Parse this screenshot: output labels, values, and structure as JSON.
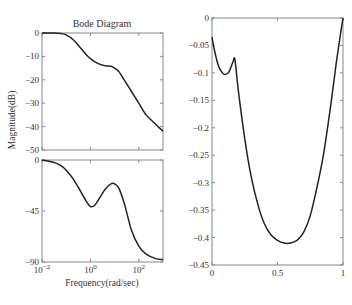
{
  "chart_data": [
    {
      "type": "line",
      "title": "Bode Diagram",
      "panel": "magnitude",
      "xlabel": "",
      "ylabel": "Magnitude(dB)",
      "xscale": "log",
      "xlim": [
        0.01,
        1000
      ],
      "ylim": [
        -50,
        0
      ],
      "yticks": [
        0,
        -10,
        -20,
        -30,
        -40,
        -50
      ],
      "ytick_labels": [
        "0",
        "-10",
        "-20",
        "-30",
        "-40",
        "-50"
      ],
      "x": [
        0.01,
        0.03,
        0.06,
        0.1,
        0.2,
        0.4,
        0.7,
        1,
        2,
        4,
        7,
        10,
        15,
        25,
        50,
        100,
        200,
        500,
        1000
      ],
      "values": [
        0,
        0,
        -0.2,
        -0.8,
        -3,
        -6.5,
        -9.5,
        -11,
        -13,
        -14,
        -14.2,
        -15,
        -16.5,
        -20,
        -25,
        -30,
        -35,
        -39,
        -42
      ]
    },
    {
      "type": "line",
      "panel": "phase",
      "xlabel": "Frequency(rad/sec)",
      "ylabel": "",
      "xscale": "log",
      "xlim": [
        0.01,
        1000
      ],
      "ylim": [
        -90,
        0
      ],
      "yticks": [
        0,
        -45,
        -90
      ],
      "ytick_labels": [
        "0",
        "-45",
        "-90"
      ],
      "xticks": [
        0.01,
        1,
        100
      ],
      "xtick_labels": [
        "10^-2",
        "10^0",
        "10^2"
      ],
      "x": [
        0.01,
        0.03,
        0.06,
        0.1,
        0.2,
        0.4,
        0.7,
        1,
        1.5,
        2.5,
        4,
        7,
        10,
        15,
        25,
        50,
        100,
        200,
        500,
        1000
      ],
      "values": [
        0,
        -2,
        -5,
        -9,
        -17,
        -28,
        -37,
        -41,
        -40,
        -33,
        -26,
        -21,
        -21,
        -25,
        -38,
        -62,
        -76,
        -83,
        -87,
        -88
      ]
    },
    {
      "type": "line",
      "panel": "right",
      "xlabel": "",
      "ylabel": "",
      "xlim": [
        0,
        1
      ],
      "ylim": [
        -0.45,
        0
      ],
      "yticks": [
        0,
        -0.05,
        -0.1,
        -0.15,
        -0.2,
        -0.25,
        -0.3,
        -0.35,
        -0.4,
        -0.45
      ],
      "ytick_labels": [
        "0",
        "-0.05",
        "-0.1",
        "-0.15",
        "-0.2",
        "-0.25",
        "-0.3",
        "-0.35",
        "-0.4",
        "-0.45"
      ],
      "xticks": [
        0,
        0.5,
        1
      ],
      "xtick_labels": [
        "0",
        "0.5",
        "1"
      ],
      "x": [
        0,
        0.02,
        0.05,
        0.08,
        0.1,
        0.13,
        0.16,
        0.175,
        0.2,
        0.25,
        0.3,
        0.35,
        0.4,
        0.45,
        0.5,
        0.55,
        0.6,
        0.65,
        0.7,
        0.75,
        0.8,
        0.85,
        0.9,
        0.95,
        0.98,
        1.0
      ],
      "values": [
        -0.035,
        -0.06,
        -0.088,
        -0.1,
        -0.103,
        -0.098,
        -0.08,
        -0.076,
        -0.13,
        -0.22,
        -0.29,
        -0.34,
        -0.375,
        -0.395,
        -0.405,
        -0.41,
        -0.41,
        -0.405,
        -0.39,
        -0.36,
        -0.31,
        -0.25,
        -0.17,
        -0.08,
        -0.03,
        0
      ]
    }
  ],
  "labels": {
    "title": "Bode Diagram",
    "ylabel_mag": "Magnitude(dB)",
    "xlabel_freq": "Frequency(rad/sec)"
  },
  "colors": {
    "line": "#222222",
    "axis": "#888888"
  }
}
